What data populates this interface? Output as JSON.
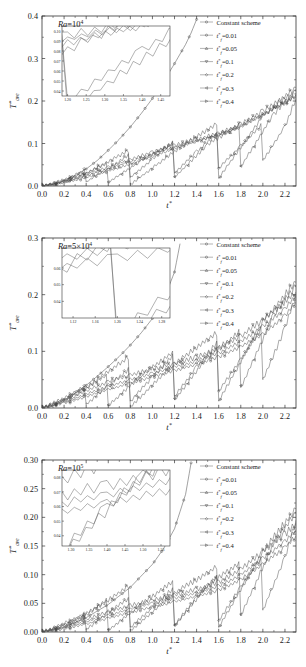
{
  "figure": {
    "name": "three-panel-line-chart",
    "xlabel": "t*",
    "ylabel": "T*ave"
  },
  "legend": {
    "entries": [
      {
        "label": "Constant scheme",
        "marker": "circle"
      },
      {
        "label": "t*f=0.01",
        "marker": "circle"
      },
      {
        "label": "t*f=0.05",
        "marker": "triangle-up"
      },
      {
        "label": "t*f=0.1",
        "marker": "triangle-down"
      },
      {
        "label": "t*f=0.2",
        "marker": "diamond"
      },
      {
        "label": "t*f=0.3",
        "marker": "triangle-left"
      },
      {
        "label": "t*f=0.4",
        "marker": "triangle-right"
      }
    ]
  },
  "chart_data": [
    {
      "type": "line",
      "id": "panel-a",
      "title": "Ra=10^4",
      "ra_base": "Ra",
      "ra_eq": "=10",
      "ra_exp": "4",
      "xlabel": "t*",
      "ylabel": "T*ave",
      "xlim": [
        0.0,
        2.3
      ],
      "ylim": [
        0.0,
        0.4
      ],
      "xticks": [
        "0.0",
        "0.2",
        "0.4",
        "0.6",
        "0.8",
        "1.0",
        "1.2",
        "1.4",
        "1.6",
        "1.8",
        "2.0",
        "2.2"
      ],
      "xtick_vals": [
        0.0,
        0.2,
        0.4,
        0.6,
        0.8,
        1.0,
        1.2,
        1.4,
        1.6,
        1.8,
        2.0,
        2.2
      ],
      "yticks": [
        "0.0",
        "0.1",
        "0.2",
        "0.3",
        "0.4"
      ],
      "ytick_vals": [
        0.0,
        0.1,
        0.2,
        0.3,
        0.4
      ],
      "grid": false,
      "legend_position": "top-right",
      "inset": {
        "xlim": [
          1.185,
          1.475
        ],
        "ylim": [
          0.035,
          0.105
        ],
        "xticks": [
          "1.20",
          "1.25",
          "1.30",
          "1.35",
          "1.40",
          "1.45"
        ],
        "xtick_vals": [
          1.2,
          1.25,
          1.3,
          1.35,
          1.4,
          1.45
        ],
        "yticks": [
          "0.04",
          "0.05",
          "0.06",
          "0.07",
          "0.08",
          "0.09",
          "0.10"
        ],
        "ytick_vals": [
          0.04,
          0.05,
          0.06,
          0.07,
          0.08,
          0.09,
          0.1
        ]
      },
      "series": [
        {
          "name": "Constant scheme",
          "marker": "circle",
          "x": [
            0.0,
            0.1,
            0.2,
            0.3,
            0.4,
            0.5,
            0.6,
            0.7,
            0.8,
            0.9,
            1.0,
            1.1,
            1.2,
            1.3,
            1.35,
            1.4
          ],
          "values": [
            0.0,
            0.004,
            0.012,
            0.024,
            0.04,
            0.06,
            0.084,
            0.11,
            0.139,
            0.171,
            0.206,
            0.245,
            0.288,
            0.333,
            0.36,
            0.392
          ]
        },
        {
          "name": "t*f=0.01",
          "marker": "circle",
          "x": [
            0.0,
            0.1,
            0.2,
            0.3,
            0.4,
            0.5,
            0.6,
            0.7,
            0.8,
            0.9,
            1.0,
            1.1,
            1.2,
            1.3,
            1.4,
            1.5,
            1.6,
            1.7,
            1.8,
            1.9,
            2.0,
            2.1,
            2.2,
            2.3
          ],
          "values": [
            0.0,
            0.003,
            0.008,
            0.013,
            0.02,
            0.027,
            0.035,
            0.043,
            0.052,
            0.061,
            0.07,
            0.079,
            0.088,
            0.097,
            0.105,
            0.113,
            0.122,
            0.131,
            0.142,
            0.155,
            0.168,
            0.182,
            0.196,
            0.21
          ]
        },
        {
          "name": "t*f=0.05",
          "marker": "triangle-up",
          "x": [
            0.0,
            0.15,
            0.3,
            0.45,
            0.6,
            0.75,
            0.9,
            1.05,
            1.2,
            1.35,
            1.5,
            1.65,
            1.8,
            1.95,
            2.1,
            2.2,
            2.3
          ],
          "values": [
            0.0,
            0.006,
            0.016,
            0.028,
            0.04,
            0.053,
            0.066,
            0.08,
            0.092,
            0.103,
            0.113,
            0.124,
            0.139,
            0.16,
            0.182,
            0.198,
            0.212
          ]
        },
        {
          "name": "t*f=0.1",
          "marker": "triangle-down",
          "x": [
            0.0,
            0.2,
            0.4,
            0.6,
            0.8,
            1.0,
            1.2,
            1.4,
            1.6,
            1.8,
            2.0,
            2.15,
            2.3
          ],
          "values": [
            0.0,
            0.01,
            0.026,
            0.044,
            0.062,
            0.08,
            0.096,
            0.11,
            0.124,
            0.145,
            0.176,
            0.2,
            0.215
          ]
        },
        {
          "name": "t*f=0.2",
          "marker": "diamond",
          "x": [
            0.0,
            0.2,
            0.4,
            0.4,
            0.6,
            0.8,
            0.8,
            1.0,
            1.2,
            1.2,
            1.4,
            1.6,
            1.6,
            1.8,
            2.0,
            2.0,
            2.2,
            2.3
          ],
          "values": [
            0.0,
            0.012,
            0.04,
            0.01,
            0.04,
            0.076,
            0.02,
            0.063,
            0.107,
            0.03,
            0.081,
            0.127,
            0.042,
            0.094,
            0.148,
            0.06,
            0.14,
            0.206
          ]
        },
        {
          "name": "t*f=0.3",
          "marker": "triangle-left",
          "x": [
            0.0,
            0.3,
            0.6,
            0.6,
            0.9,
            1.2,
            1.2,
            1.5,
            1.8,
            1.8,
            2.1,
            2.3
          ],
          "values": [
            0.0,
            0.018,
            0.055,
            0.008,
            0.06,
            0.103,
            0.02,
            0.098,
            0.145,
            0.045,
            0.17,
            0.225
          ]
        },
        {
          "name": "t*f=0.4",
          "marker": "triangle-right",
          "x": [
            0.0,
            0.4,
            0.8,
            0.8,
            1.2,
            1.6,
            1.6,
            2.0,
            2.3
          ],
          "values": [
            0.0,
            0.03,
            0.085,
            0.003,
            0.082,
            0.15,
            0.018,
            0.165,
            0.232
          ]
        }
      ]
    },
    {
      "type": "line",
      "id": "panel-b",
      "title": "Ra=5x10^4",
      "ra_base": "Ra",
      "ra_eq": "=5×10",
      "ra_exp": "4",
      "xlabel": "t*",
      "ylabel": "T*ave",
      "xlim": [
        0.0,
        2.3
      ],
      "ylim": [
        0.0,
        0.3
      ],
      "xticks": [
        "0.0",
        "0.2",
        "0.4",
        "0.6",
        "0.8",
        "1.0",
        "1.2",
        "1.4",
        "1.6",
        "1.8",
        "2.0",
        "2.2"
      ],
      "xtick_vals": [
        0.0,
        0.2,
        0.4,
        0.6,
        0.8,
        1.0,
        1.2,
        1.4,
        1.6,
        1.8,
        2.0,
        2.2
      ],
      "yticks": [
        "0.0",
        "0.1",
        "0.2",
        "0.3"
      ],
      "ytick_vals": [
        0.0,
        0.1,
        0.2,
        0.3
      ],
      "grid": false,
      "legend_position": "top-right",
      "inset": {
        "xlim": [
          1.1,
          1.295
        ],
        "ylim": [
          0.03,
          0.072
        ],
        "xticks": [
          "1.12",
          "1.16",
          "1.20",
          "1.24",
          "1.28"
        ],
        "xtick_vals": [
          1.12,
          1.16,
          1.2,
          1.24,
          1.28
        ],
        "yticks": [
          "0.04",
          "0.05",
          "0.06"
        ],
        "ytick_vals": [
          0.04,
          0.05,
          0.06
        ]
      },
      "series": [
        {
          "name": "Constant scheme",
          "marker": "circle",
          "x": [
            0.0,
            0.1,
            0.2,
            0.3,
            0.4,
            0.5,
            0.6,
            0.7,
            0.8,
            0.9,
            1.0,
            1.1,
            1.2,
            1.25
          ],
          "values": [
            0.0,
            0.004,
            0.014,
            0.026,
            0.04,
            0.056,
            0.073,
            0.091,
            0.111,
            0.133,
            0.158,
            0.19,
            0.24,
            0.29
          ]
        },
        {
          "name": "t*f=0.01",
          "marker": "circle",
          "x": [
            0.0,
            0.2,
            0.4,
            0.6,
            0.8,
            1.0,
            1.2,
            1.4,
            1.6,
            1.8,
            2.0,
            2.2,
            2.3
          ],
          "values": [
            0.0,
            0.008,
            0.02,
            0.032,
            0.044,
            0.055,
            0.066,
            0.077,
            0.09,
            0.108,
            0.13,
            0.162,
            0.188
          ]
        },
        {
          "name": "t*f=0.05",
          "marker": "triangle-up",
          "x": [
            0.0,
            0.2,
            0.4,
            0.6,
            0.8,
            1.0,
            1.2,
            1.4,
            1.6,
            1.8,
            2.0,
            2.2,
            2.3
          ],
          "values": [
            0.0,
            0.01,
            0.024,
            0.038,
            0.05,
            0.061,
            0.072,
            0.083,
            0.097,
            0.117,
            0.143,
            0.175,
            0.198
          ]
        },
        {
          "name": "t*f=0.1",
          "marker": "triangle-down",
          "x": [
            0.0,
            0.2,
            0.4,
            0.6,
            0.8,
            1.0,
            1.2,
            1.4,
            1.6,
            1.8,
            2.0,
            2.2,
            2.3
          ],
          "values": [
            0.0,
            0.012,
            0.03,
            0.046,
            0.058,
            0.068,
            0.078,
            0.09,
            0.105,
            0.126,
            0.155,
            0.188,
            0.205
          ]
        },
        {
          "name": "t*f=0.2",
          "marker": "diamond",
          "x": [
            0.0,
            0.2,
            0.4,
            0.4,
            0.6,
            0.8,
            0.8,
            1.0,
            1.2,
            1.2,
            1.4,
            1.6,
            1.6,
            1.8,
            2.0,
            2.0,
            2.2,
            2.3
          ],
          "values": [
            0.0,
            0.014,
            0.04,
            0.006,
            0.04,
            0.07,
            0.012,
            0.055,
            0.095,
            0.02,
            0.072,
            0.118,
            0.03,
            0.085,
            0.145,
            0.05,
            0.14,
            0.2
          ]
        },
        {
          "name": "t*f=0.3",
          "marker": "triangle-left",
          "x": [
            0.0,
            0.3,
            0.6,
            0.6,
            0.9,
            1.2,
            1.2,
            1.5,
            1.8,
            1.8,
            2.1,
            2.3
          ],
          "values": [
            0.0,
            0.022,
            0.06,
            0.004,
            0.058,
            0.1,
            0.014,
            0.09,
            0.136,
            0.036,
            0.165,
            0.215
          ]
        },
        {
          "name": "t*f=0.4",
          "marker": "triangle-right",
          "x": [
            0.0,
            0.4,
            0.8,
            0.8,
            1.2,
            1.6,
            1.6,
            2.0,
            2.3
          ],
          "values": [
            0.0,
            0.036,
            0.092,
            0.002,
            0.078,
            0.135,
            0.012,
            0.152,
            0.222
          ]
        }
      ]
    },
    {
      "type": "line",
      "id": "panel-c",
      "title": "Ra=10^5",
      "ra_base": "Ra",
      "ra_eq": "=10",
      "ra_exp": "5",
      "xlabel": "t*",
      "ylabel": "T*ave",
      "xlim": [
        0.0,
        2.3
      ],
      "ylim": [
        0.0,
        0.3
      ],
      "xticks": [
        "0.0",
        "0.2",
        "0.4",
        "0.6",
        "0.8",
        "1.0",
        "1.2",
        "1.4",
        "1.6",
        "1.8",
        "2.0",
        "2.2"
      ],
      "xtick_vals": [
        0.0,
        0.2,
        0.4,
        0.6,
        0.8,
        1.0,
        1.2,
        1.4,
        1.6,
        1.8,
        2.0,
        2.2
      ],
      "yticks": [
        "0.00",
        "0.05",
        "0.10",
        "0.15",
        "0.20",
        "0.25",
        "0.30"
      ],
      "ytick_vals": [
        0.0,
        0.05,
        0.1,
        0.15,
        0.2,
        0.25,
        0.3
      ],
      "grid": false,
      "legend_position": "top-right",
      "inset": {
        "xlim": [
          1.275,
          1.575
        ],
        "ylim": [
          0.033,
          0.085
        ],
        "xticks": [
          "1.30",
          "1.35",
          "1.40",
          "1.45",
          "1.50",
          "1.55"
        ],
        "xtick_vals": [
          1.3,
          1.35,
          1.4,
          1.45,
          1.5,
          1.55
        ],
        "yticks": [
          "0.04",
          "0.05",
          "0.06",
          "0.07",
          "0.08"
        ],
        "ytick_vals": [
          0.04,
          0.05,
          0.06,
          0.07,
          0.08
        ]
      },
      "series": [
        {
          "name": "Constant scheme",
          "marker": "circle",
          "x": [
            0.0,
            0.2,
            0.4,
            0.6,
            0.8,
            1.0,
            1.1,
            1.2,
            1.3,
            1.35
          ],
          "values": [
            0.0,
            0.008,
            0.025,
            0.048,
            0.078,
            0.118,
            0.145,
            0.18,
            0.24,
            0.295
          ]
        },
        {
          "name": "t*f=0.01",
          "marker": "circle",
          "x": [
            0.0,
            0.2,
            0.4,
            0.6,
            0.8,
            1.0,
            1.2,
            1.4,
            1.6,
            1.8,
            2.0,
            2.2,
            2.3
          ],
          "values": [
            0.0,
            0.005,
            0.014,
            0.024,
            0.034,
            0.044,
            0.053,
            0.062,
            0.073,
            0.092,
            0.118,
            0.148,
            0.168
          ]
        },
        {
          "name": "t*f=0.05",
          "marker": "triangle-up",
          "x": [
            0.0,
            0.2,
            0.4,
            0.6,
            0.8,
            1.0,
            1.2,
            1.4,
            1.6,
            1.8,
            2.0,
            2.2,
            2.3
          ],
          "values": [
            0.0,
            0.007,
            0.018,
            0.029,
            0.04,
            0.05,
            0.059,
            0.068,
            0.08,
            0.1,
            0.128,
            0.158,
            0.178
          ]
        },
        {
          "name": "t*f=0.1",
          "marker": "triangle-down",
          "x": [
            0.0,
            0.2,
            0.4,
            0.6,
            0.8,
            1.0,
            1.2,
            1.4,
            1.6,
            1.8,
            2.0,
            2.2,
            2.3
          ],
          "values": [
            0.0,
            0.009,
            0.022,
            0.035,
            0.046,
            0.055,
            0.064,
            0.074,
            0.087,
            0.11,
            0.14,
            0.17,
            0.19
          ]
        },
        {
          "name": "t*f=0.2",
          "marker": "diamond",
          "x": [
            0.0,
            0.2,
            0.4,
            0.4,
            0.6,
            0.8,
            0.8,
            1.0,
            1.2,
            1.2,
            1.4,
            1.6,
            1.6,
            1.8,
            2.0,
            2.0,
            2.2,
            2.3
          ],
          "values": [
            0.0,
            0.012,
            0.032,
            0.004,
            0.034,
            0.06,
            0.008,
            0.042,
            0.078,
            0.012,
            0.06,
            0.1,
            0.02,
            0.078,
            0.132,
            0.038,
            0.13,
            0.195
          ]
        },
        {
          "name": "t*f=0.3",
          "marker": "triangle-left",
          "x": [
            0.0,
            0.3,
            0.6,
            0.6,
            0.9,
            1.2,
            1.2,
            1.5,
            1.8,
            1.8,
            2.1,
            2.3
          ],
          "values": [
            0.0,
            0.018,
            0.058,
            0.003,
            0.048,
            0.09,
            0.01,
            0.082,
            0.122,
            0.028,
            0.155,
            0.208
          ]
        },
        {
          "name": "t*f=0.4",
          "marker": "triangle-right",
          "x": [
            0.0,
            0.4,
            0.8,
            0.8,
            1.2,
            1.6,
            1.6,
            2.0,
            2.3
          ],
          "values": [
            0.0,
            0.03,
            0.082,
            0.002,
            0.068,
            0.115,
            0.008,
            0.14,
            0.215
          ]
        }
      ]
    }
  ]
}
